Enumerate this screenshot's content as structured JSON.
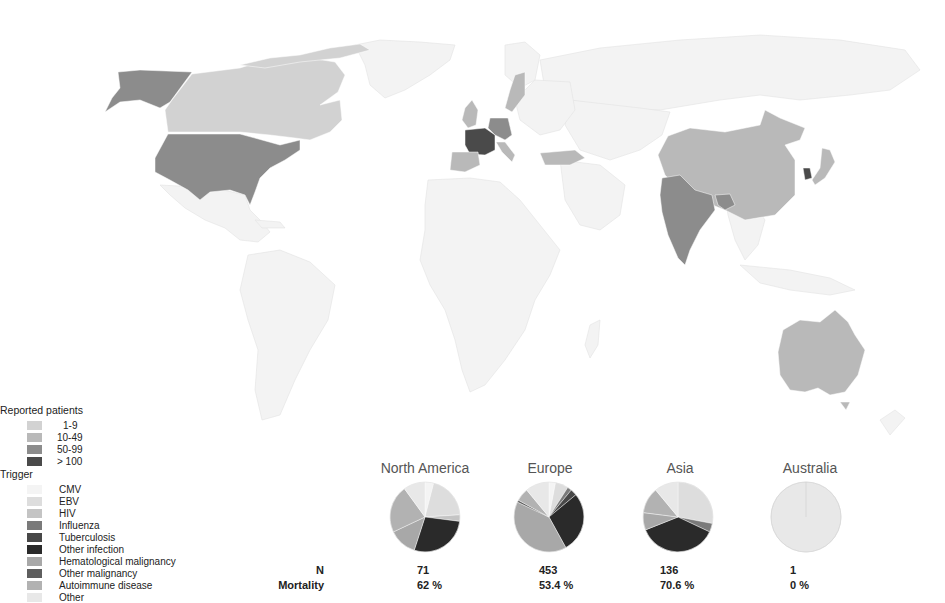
{
  "map": {
    "background": "#ffffff",
    "base_land_color": "#f3f3f3",
    "colors": {
      "1-9": "#d2d2d2",
      "10-49": "#b9b9b9",
      "50-99": "#8c8c8c",
      "gt100": "#4a4a4a"
    },
    "countries": [
      {
        "name": "Alaska (USA)",
        "category": "50-99"
      },
      {
        "name": "Canada",
        "category": "1-9"
      },
      {
        "name": "USA",
        "category": "50-99"
      },
      {
        "name": "France",
        "category": "gt100"
      },
      {
        "name": "Germany",
        "category": "50-99"
      },
      {
        "name": "Spain",
        "category": "10-49"
      },
      {
        "name": "United Kingdom",
        "category": "10-49"
      },
      {
        "name": "Sweden",
        "category": "10-49"
      },
      {
        "name": "Italy",
        "category": "10-49"
      },
      {
        "name": "Turkey",
        "category": "10-49"
      },
      {
        "name": "India",
        "category": "50-99"
      },
      {
        "name": "China",
        "category": "10-49"
      },
      {
        "name": "South Korea",
        "category": "gt100"
      },
      {
        "name": "Japan",
        "category": "10-49"
      },
      {
        "name": "Bangladesh",
        "category": "50-99"
      },
      {
        "name": "Australia",
        "category": "10-49"
      }
    ]
  },
  "patients_legend": {
    "title": "Reported patients",
    "items": [
      {
        "label": "1-9",
        "color": "#d2d2d2"
      },
      {
        "label": "10-49",
        "color": "#b9b9b9"
      },
      {
        "label": "50-99",
        "color": "#8c8c8c"
      },
      {
        "label": "> 100",
        "color": "#4a4a4a"
      }
    ]
  },
  "trigger_legend": {
    "title": "Trigger",
    "items": [
      {
        "label": "CMV",
        "color": "#f4f4f4"
      },
      {
        "label": "EBV",
        "color": "#dddddd"
      },
      {
        "label": "HIV",
        "color": "#c4c4c4"
      },
      {
        "label": "Influenza",
        "color": "#7a7a7a"
      },
      {
        "label": "Tuberculosis",
        "color": "#484848"
      },
      {
        "label": "Other infection",
        "color": "#2a2a2a"
      },
      {
        "label": "Hematological malignancy",
        "color": "#a8a8a8"
      },
      {
        "label": "Other malignancy",
        "color": "#5e5e5e"
      },
      {
        "label": "Autoimmune disease",
        "color": "#b2b2b2"
      },
      {
        "label": "Other",
        "color": "#e8e8e8"
      }
    ]
  },
  "stats_labels": {
    "n": "N",
    "mortality": "Mortality"
  },
  "chart_data": {
    "type": "pie",
    "legend_position": "left",
    "categories": [
      "CMV",
      "EBV",
      "HIV",
      "Influenza",
      "Tuberculosis",
      "Other infection",
      "Hematological malignancy",
      "Other malignancy",
      "Autoimmune disease",
      "Other"
    ],
    "regions": [
      {
        "name": "North America",
        "n": "71",
        "mortality": "62 %",
        "values": [
          4,
          20,
          3,
          0,
          0,
          28,
          13,
          0,
          22,
          10
        ]
      },
      {
        "name": "Europe",
        "n": "453",
        "mortality": "53.4 %",
        "values": [
          3,
          6,
          0,
          2,
          3,
          28,
          40,
          1,
          6,
          11
        ]
      },
      {
        "name": "Asia",
        "n": "136",
        "mortality": "70.6 %",
        "values": [
          0,
          28,
          0,
          4,
          0,
          37,
          8,
          0,
          12,
          11
        ]
      },
      {
        "name": "Australia",
        "n": "1",
        "mortality": "0 %",
        "values": [
          0,
          0,
          0,
          0,
          0,
          0,
          0,
          0,
          0,
          100
        ]
      }
    ]
  }
}
